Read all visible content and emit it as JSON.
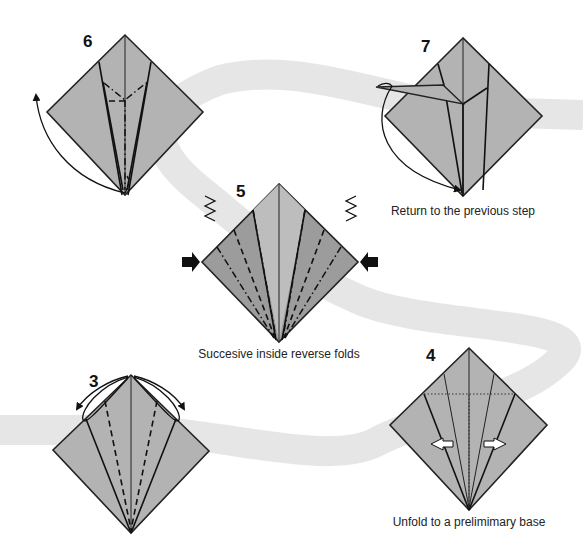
{
  "diagram": {
    "colors": {
      "paper": "#b3b3b3",
      "paper_dark": "#9c9c9c",
      "band": "#e6e6e6",
      "lines": "#111111"
    },
    "steps": [
      {
        "number": "3",
        "caption": "",
        "icons": [
          "open-flap-arrow-left",
          "open-flap-arrow-right",
          "valley-fold-lines"
        ]
      },
      {
        "number": "4",
        "caption": "Unfold to a prelimimary base",
        "icons": [
          "unfold-arrow-left",
          "unfold-arrow-right",
          "dotted-crease-lines"
        ]
      },
      {
        "number": "5",
        "caption": "Succesive inside reverse folds",
        "icons": [
          "push-arrow-left",
          "push-arrow-right",
          "reverse-fold-symbol-left",
          "reverse-fold-symbol-right"
        ]
      },
      {
        "number": "6",
        "caption": "",
        "icons": [
          "curved-fold-arrow",
          "mountain-fold-lines"
        ]
      },
      {
        "number": "7",
        "caption": "Return to the previous step",
        "icons": [
          "return-arrow"
        ]
      }
    ]
  }
}
